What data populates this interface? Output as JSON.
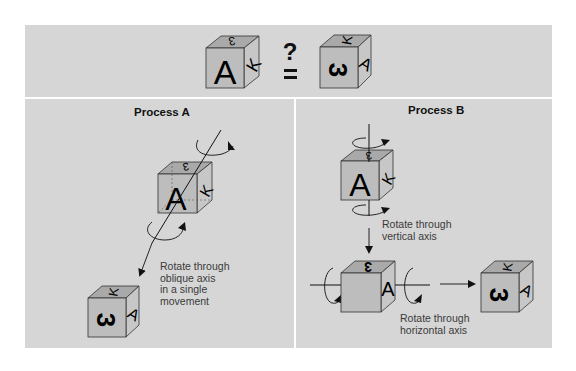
{
  "top": {
    "question_mark": "?",
    "equals_sign": "=",
    "left_cube": {
      "front": "A",
      "top": "3",
      "side": "K"
    },
    "right_cube": {
      "front": "3",
      "top": "K",
      "side": "A"
    }
  },
  "process_a": {
    "heading": "Process A",
    "caption_lines": [
      "Rotate through",
      "oblique axis",
      "in a single",
      "movement"
    ],
    "start_cube": {
      "front": "A",
      "top": "3",
      "side": "K"
    },
    "end_cube": {
      "front": "3",
      "top": "K",
      "side": "A"
    }
  },
  "process_b": {
    "heading": "Process B",
    "caption_vertical_lines": [
      "Rotate through",
      "vertical axis"
    ],
    "caption_horizontal_lines": [
      "Rotate through",
      "horizontal axis"
    ],
    "start_cube": {
      "front": "A",
      "top": "3",
      "side": "K"
    },
    "middle_cube": {
      "front": "",
      "top": "3",
      "side": "A"
    },
    "end_cube": {
      "front": "3",
      "top": "K",
      "side": "A"
    }
  },
  "colors": {
    "panel_bg": "#d6d6d6",
    "cube_front": "#bdbdbd",
    "cube_top": "#a9a9a9",
    "cube_side": "#c7c7c7",
    "line": "#111111"
  }
}
